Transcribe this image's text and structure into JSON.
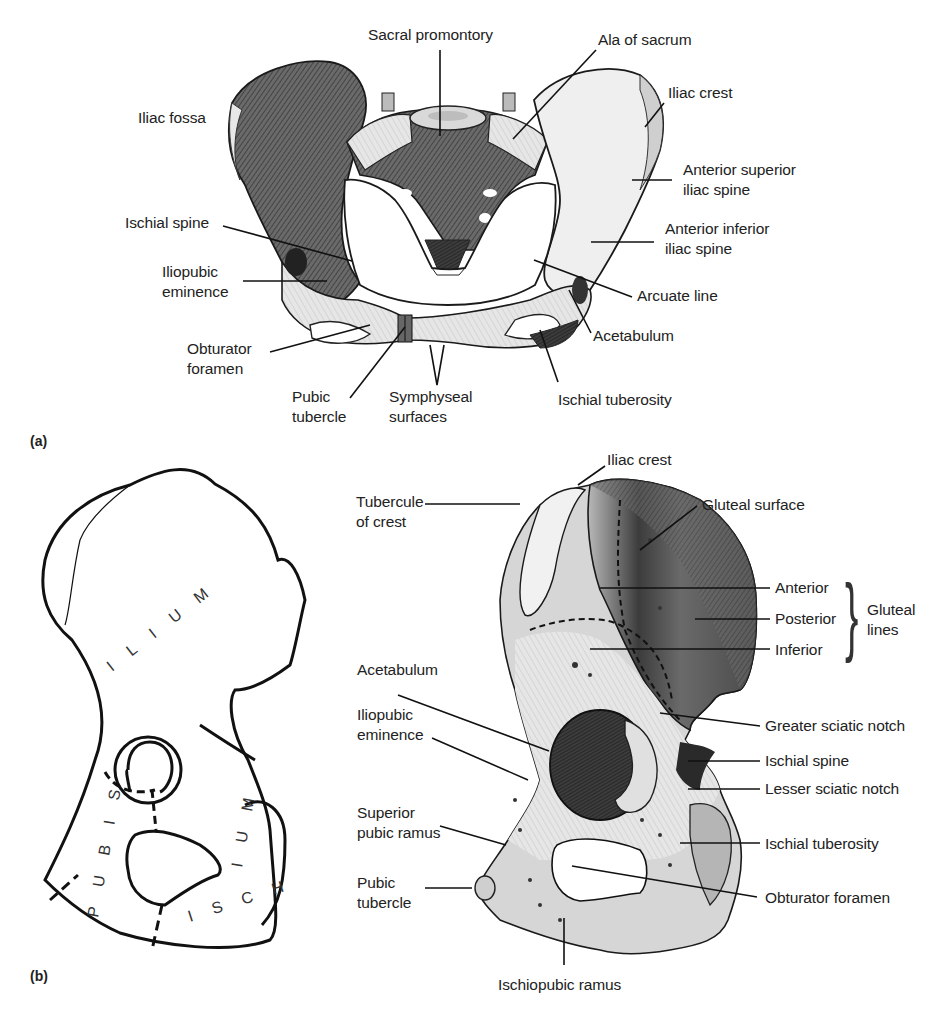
{
  "figure": {
    "panels": [
      {
        "id": "a",
        "tag": "(a)",
        "view": "anterior view of pelvis",
        "labels": [
          {
            "text": "Sacral promontory",
            "x": 368,
            "y": 25
          },
          {
            "text": "Ala of sacrum",
            "x": 598,
            "y": 30
          },
          {
            "text": "Iliac fossa",
            "x": 138,
            "y": 108
          },
          {
            "text": "Iliac crest",
            "x": 668,
            "y": 83
          },
          {
            "text": "Anterior superior\niliac spine",
            "x": 683,
            "y": 160
          },
          {
            "text": "Ischial spine",
            "x": 125,
            "y": 213
          },
          {
            "text": "Anterior inferior\niliac spine",
            "x": 665,
            "y": 219
          },
          {
            "text": "Iliopubic\neminence",
            "x": 162,
            "y": 262
          },
          {
            "text": "Arcuate line",
            "x": 637,
            "y": 286
          },
          {
            "text": "Acetabulum",
            "x": 593,
            "y": 326
          },
          {
            "text": "Obturator\nforamen",
            "x": 187,
            "y": 339
          },
          {
            "text": "Pubic\ntubercle",
            "x": 292,
            "y": 387
          },
          {
            "text": "Symphyseal\nsurfaces",
            "x": 389,
            "y": 387
          },
          {
            "text": "Ischial tuberosity",
            "x": 558,
            "y": 390
          }
        ]
      },
      {
        "id": "b",
        "tag": "(b)",
        "view": "lateral view of right hip bone",
        "schematic_regions": [
          "ILIUM",
          "PUBIS",
          "ISCHIUM"
        ],
        "labels": [
          {
            "text": "Iliac crest",
            "x": 607,
            "y": 450
          },
          {
            "text": "Tubercule\nof crest",
            "x": 356,
            "y": 492
          },
          {
            "text": "Gluteal surface",
            "x": 702,
            "y": 495
          },
          {
            "text": "Anterior",
            "x": 775,
            "y": 578
          },
          {
            "text": "Posterior",
            "x": 775,
            "y": 609
          },
          {
            "text": "Inferior",
            "x": 775,
            "y": 640
          },
          {
            "text": "Gluteal\nlines",
            "x": 867,
            "y": 600
          },
          {
            "text": "Acetabulum",
            "x": 357,
            "y": 660
          },
          {
            "text": "Iliopubic\neminence",
            "x": 357,
            "y": 705
          },
          {
            "text": "Greater sciatic notch",
            "x": 765,
            "y": 716
          },
          {
            "text": "Ischial spine",
            "x": 765,
            "y": 751
          },
          {
            "text": "Lesser sciatic notch",
            "x": 765,
            "y": 779
          },
          {
            "text": "Superior\npubic ramus",
            "x": 357,
            "y": 803
          },
          {
            "text": "Ischial tuberosity",
            "x": 765,
            "y": 834
          },
          {
            "text": "Pubic\ntubercle",
            "x": 357,
            "y": 873
          },
          {
            "text": "Obturator foramen",
            "x": 765,
            "y": 888
          },
          {
            "text": "Ischiopubic ramus",
            "x": 498,
            "y": 975
          }
        ]
      }
    ]
  }
}
